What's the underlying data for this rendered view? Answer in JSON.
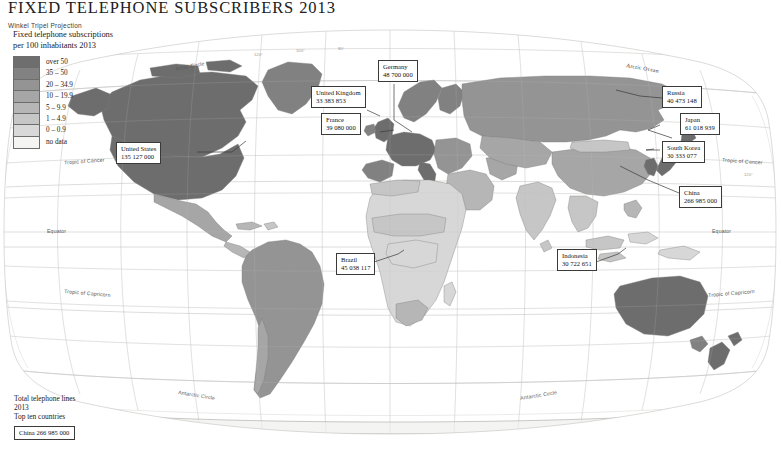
{
  "header": {
    "title": "FIXED TELEPHONE SUBSCRIBERS 2013",
    "subtitle": "Winkel Tripel Projection"
  },
  "legend": {
    "title_line1": "Fixed telephone subscriptions",
    "title_line2": "per 100 inhabitants 2013",
    "classes": [
      {
        "label": "over 50",
        "color": "#6e6e6e"
      },
      {
        "label": "35 – 50",
        "color": "#828282"
      },
      {
        "label": "20 – 34.9",
        "color": "#949494"
      },
      {
        "label": "10 – 19.9",
        "color": "#a6a6a6"
      },
      {
        "label": "5 – 9.9",
        "color": "#b6b6b6"
      },
      {
        "label": "1 – 4.9",
        "color": "#c6c6c6"
      },
      {
        "label": "0 – 0.9",
        "color": "#d8d8d8"
      },
      {
        "label": "no data",
        "color": "#f4f4f2"
      }
    ]
  },
  "callouts": [
    {
      "name": "United States",
      "value": "135 127 000"
    },
    {
      "name": "Germany",
      "value": "48 700 000"
    },
    {
      "name": "United Kingdom",
      "value": "33 383 853"
    },
    {
      "name": "France",
      "value": "39 080 000"
    },
    {
      "name": "Russia",
      "value": "40 473 148"
    },
    {
      "name": "Japan",
      "value": "61 018 939"
    },
    {
      "name": "South Korea",
      "value": "30 333 077"
    },
    {
      "name": "China",
      "value": "266 985 000"
    },
    {
      "name": "Brazil",
      "value": "45 038 117"
    },
    {
      "name": "Indonesia",
      "value": "30 722 651"
    }
  ],
  "stats": {
    "line1": "Total telephone lines",
    "line2": "2013",
    "line3": "Top ten countries",
    "top_country": {
      "name": "China",
      "value": "266 985 000"
    }
  },
  "geo_labels": {
    "arctic_circle_west": "Arctic Circle",
    "arctic_ocean": "Arctic Ocean",
    "tropic_cancer_west": "Tropic of Cancer",
    "tropic_cancer_east": "Tropic of Cancer",
    "equator_west": "Equator",
    "equator_east": "Equator",
    "tropic_capricorn_west": "Tropic of Capricorn",
    "tropic_capricorn_east": "Tropic of Capricorn",
    "antarctic_circle_west": "Antarctic Circle",
    "antarctic_circle_east": "Antarctic Circle"
  },
  "graticule_labels": {
    "top": [
      "120°",
      "100°",
      "80°"
    ],
    "right_cancer": "120°"
  },
  "colors": {
    "ocean": "#ffffff",
    "graticule": "#d2d2d0",
    "coastline": "#8a8a88",
    "frame": "#b8b8b6",
    "no_data": "#f4f4f2"
  }
}
